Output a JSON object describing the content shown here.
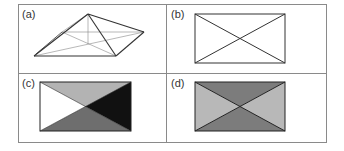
{
  "panels": [
    {
      "id": "a",
      "label": "(a)",
      "description": "pyramid wireframe"
    },
    {
      "id": "b",
      "label": "(b)",
      "description": "rectangle with diagonals"
    },
    {
      "id": "c",
      "label": "(c)",
      "description": "rectangle with four shaded triangles",
      "colors": {
        "top": "#b3b3b3",
        "right": "#111111",
        "bottom": "#6e6e6e",
        "left": "#ffffff"
      }
    },
    {
      "id": "d",
      "label": "(d)",
      "description": "rectangle with alternating shaded triangles",
      "colors": {
        "top": "#7c7c7c",
        "right": "#b8b8b8",
        "bottom": "#7c7c7c",
        "left": "#b8b8b8"
      }
    }
  ],
  "colors": {
    "grid": "#8a8a8a",
    "stroke": "#333333"
  }
}
